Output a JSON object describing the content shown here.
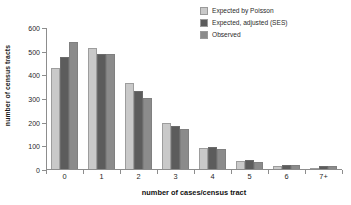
{
  "chart_data": {
    "type": "bar",
    "title": "",
    "xlabel": "number of cases/census tract",
    "ylabel": "number of census tracts",
    "categories": [
      "0",
      "1",
      "2",
      "3",
      "4",
      "5",
      "6",
      "7+"
    ],
    "ylim": [
      0,
      600
    ],
    "yticks": [
      0,
      100,
      200,
      300,
      400,
      500,
      600
    ],
    "grid": false,
    "legend_position": "top-right",
    "series": [
      {
        "name": "Expected by Poisson",
        "color": "#c9c9c9",
        "values": [
          425,
          511,
          363,
          195,
          88,
          34,
          11,
          5
        ]
      },
      {
        "name": "Expected, adjusted (SES)",
        "color": "#5c5c5c",
        "values": [
          473,
          488,
          330,
          181,
          91,
          40,
          15,
          11
        ]
      },
      {
        "name": "Observed",
        "color": "#8b8b8b",
        "values": [
          535,
          485,
          302,
          168,
          84,
          30,
          19,
          12
        ]
      }
    ]
  },
  "legend": {
    "items": [
      {
        "label": "Expected by Poisson",
        "color": "#c9c9c9"
      },
      {
        "label": "Expected, adjusted (SES)",
        "color": "#5c5c5c"
      },
      {
        "label": "Observed",
        "color": "#8b8b8b"
      }
    ]
  },
  "axes": {
    "y_title": "number of census tracts",
    "x_title": "number of cases/census tract",
    "y_tick_labels": [
      "600",
      "500",
      "400",
      "300",
      "200",
      "100",
      "0"
    ],
    "x_tick_labels": [
      "0",
      "1",
      "2",
      "3",
      "4",
      "5",
      "6",
      "7+"
    ]
  }
}
